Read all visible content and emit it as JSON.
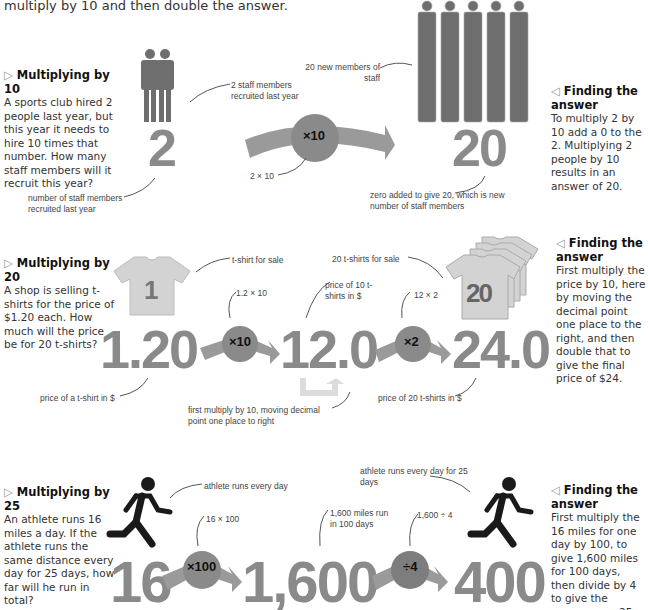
{
  "intro": "multiply by 10 and then double the answer.",
  "colors": {
    "figure": "#8a8a8a",
    "arrow_body": "#9a9a9a",
    "shirt": "#d0d0d0",
    "text": "#333333",
    "runner": "#1a1a1a"
  },
  "sections": [
    {
      "title": "Multiplying by 10",
      "body": "A sports club hired 2 people last year, but this year it needs to hire 10 times that number. How many staff members will it recruit this year?",
      "answer_title": "Finding the answer",
      "answer_body": "To multiply 2 by 10 add a 0 to the 2. Multiplying 2 people by 10 results in an answer of 20.",
      "start_value": "2",
      "operator": "×10",
      "result": "20",
      "labels": {
        "start_people": "2 staff members recruited last year",
        "start_number": "number of staff members recruited last year",
        "operation": "2 × 10",
        "end_people": "20 new members of staff",
        "end_number": "zero added to give 20, which is new number of staff members"
      }
    },
    {
      "title": "Multiplying by 20",
      "body": "A shop is selling t-shirts for the price of $1.20 each. How much will the price be for 20 t-shirts?",
      "answer_title": "Finding the answer",
      "answer_body": "First multiply the price by 10, here by moving the decimal point one place to the right, and then double that to give the final price of $24.",
      "start_value": "1.20",
      "operator1": "×10",
      "mid_value": "12.0",
      "operator2": "×2",
      "result": "24.0",
      "shirt_single": "1",
      "shirt_stack": "20",
      "labels": {
        "shirt_single": "t-shirt for sale",
        "op1": "1.2 × 10",
        "mid": "price of 10 t-shirts in $",
        "op2": "12 × 2",
        "shirt_stack": "20 t-shirts for sale",
        "start_number": "price of a t-shirt in $",
        "shift": "first multiply by 10, moving decimal point one place to right",
        "result": "price of 20 t-shirts in $"
      }
    },
    {
      "title": "Multiplying by 25",
      "body": "An athlete runs 16 miles a day. If the athlete runs the same distance every day for 25 days, how far will he run in total?",
      "answer_title": "Finding the answer",
      "answer_body": "First multiply the 16 miles for one day by 100, to give 1,600 miles for 100 days, then divide by 4 to give the answer over 25 days.",
      "start_value": "16",
      "operator1": "×100",
      "mid_value": "1,600",
      "operator2": "÷4",
      "result": "400",
      "labels": {
        "runner_start": "athlete runs every day",
        "op1": "16 × 100",
        "mid": "1,600 miles run in 100 days",
        "op2": "1,600 ÷ 4",
        "runner_end": "athlete runs every day for 25 days"
      }
    }
  ]
}
